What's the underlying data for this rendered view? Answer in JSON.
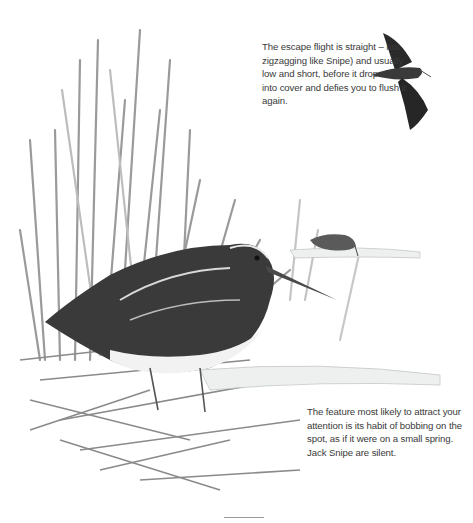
{
  "captions": {
    "top": "The escape flight is straight – not zigzagging like Snipe) and usually low and short, before it drops back into cover and defies you to flush it again.",
    "bottom": "The feature most likely to attract your attention is its habit of bobbing on the spot, as if it were on a small spring. Jack Snipe are silent."
  },
  "illustrations": {
    "main": "jack-snipe-standing-in-reeds",
    "flight": "jack-snipe-in-flight",
    "distant": "jack-snipe-feeding-distant"
  },
  "colors": {
    "ink_dark": "#1e1e1e",
    "ink_mid": "#6d6d6d",
    "ink_light": "#b8b8b8",
    "water": "#eef0f0"
  }
}
